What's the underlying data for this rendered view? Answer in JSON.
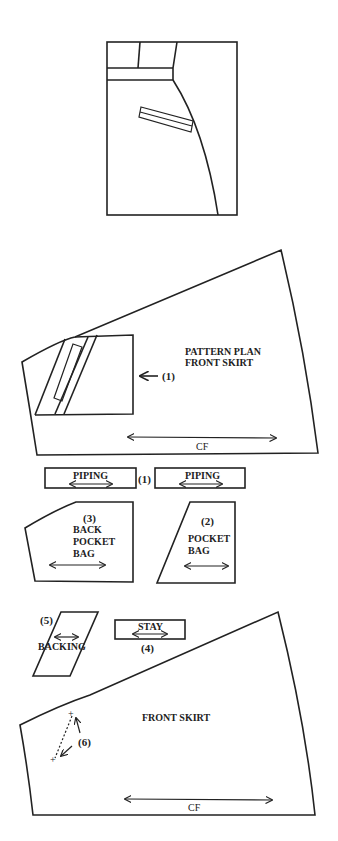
{
  "figure": {
    "type": "pattern diagram",
    "top_sketch": "skirt front with waistband, side pocket opening and welt pocket"
  },
  "pattern_plan": {
    "title_line1": "PATTERN PLAN",
    "title_line2": "FRONT SKIRT",
    "pointer_label": "(1)",
    "grain_label": "CF"
  },
  "pieces": {
    "piping": {
      "label": "PIPING",
      "number": "(1)"
    },
    "back_pocket_bag": {
      "number": "(3)",
      "line1": "BACK",
      "line2": "POCKET",
      "line3": "BAG"
    },
    "pocket_bag": {
      "number": "(2)",
      "line1": "POCKET",
      "line2": "BAG"
    },
    "backing": {
      "number": "(5)",
      "label": "BACKING"
    },
    "stay": {
      "label": "STAY",
      "number": "(4)"
    },
    "front_skirt": {
      "label": "FRONT SKIRT",
      "marker": "(6)",
      "grain_label": "CF"
    }
  }
}
